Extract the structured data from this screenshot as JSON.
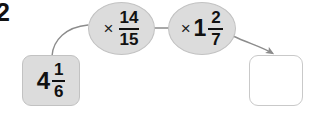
{
  "worksheet": {
    "question_number": "2",
    "width": 309,
    "height": 117
  },
  "colors": {
    "shape_fill": "#dcdcdc",
    "shape_border": "#c2c2c2",
    "answer_fill": "#ffffff",
    "answer_border": "#c9c9c9",
    "connector": "#8c8c8c",
    "text": "#111111",
    "background": "#ffffff"
  },
  "diagram": {
    "type": "function-machine",
    "input": {
      "label": "4 1/6",
      "whole": "4",
      "numerator": "1",
      "denominator": "6",
      "filled": true
    },
    "operations": [
      {
        "label": "× 14/15",
        "operator": "×",
        "whole": "",
        "numerator": "14",
        "denominator": "15"
      },
      {
        "label": "× 1 2/7",
        "operator": "×",
        "whole": "1",
        "numerator": "2",
        "denominator": "7"
      }
    ],
    "output": {
      "label": "",
      "whole": "",
      "numerator": "",
      "denominator": "",
      "filled": false
    },
    "connectors": [
      {
        "name": "input-to-op1",
        "style": "curve",
        "arrowhead": false
      },
      {
        "name": "op1-to-op2",
        "style": "straight",
        "arrowhead": false
      },
      {
        "name": "op2-to-output",
        "style": "curve",
        "arrowhead": true
      }
    ]
  }
}
